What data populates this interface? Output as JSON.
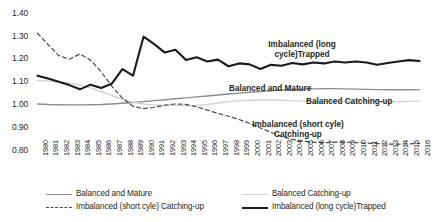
{
  "chart_data": {
    "type": "line",
    "title": "",
    "xlabel": "",
    "ylabel": "",
    "ylim": [
      0.8,
      1.4
    ],
    "ytick_labels": [
      "1.40",
      "1.30",
      "1.20",
      "1.10",
      "1.00",
      "0.90",
      "0.80"
    ],
    "ytick_values": [
      1.4,
      1.3,
      1.2,
      1.1,
      1.0,
      0.9,
      0.8
    ],
    "grid": false,
    "legend_position": "bottom",
    "x": [
      1980,
      1981,
      1982,
      1983,
      1984,
      1985,
      1986,
      1987,
      1988,
      1989,
      1990,
      1991,
      1992,
      1993,
      1994,
      1995,
      1996,
      1997,
      1998,
      1999,
      2000,
      2001,
      2002,
      2003,
      2004,
      2005,
      2006,
      2007,
      2008,
      2009,
      2010,
      2011,
      2012,
      2013,
      2014,
      2015,
      2016
    ],
    "categories": [
      "1980",
      "1981",
      "1982",
      "1983",
      "1984",
      "1985",
      "1986",
      "1987",
      "1988",
      "1989",
      "1990",
      "1991",
      "1992",
      "1993",
      "1994",
      "1995",
      "1996",
      "1997",
      "1998",
      "1999",
      "2000",
      "2001",
      "2002",
      "2003",
      "2004",
      "2005",
      "2006",
      "2007",
      "2008",
      "2009",
      "2010",
      "2011",
      "2012",
      "2013",
      "2014",
      "2015",
      "2016"
    ],
    "series": [
      {
        "name": "Balanced and Mature",
        "style": "solid",
        "color": "#8d8d8d",
        "width": 1.4,
        "values": [
          1.01,
          1.008,
          1.007,
          1.006,
          1.006,
          1.007,
          1.008,
          1.01,
          1.013,
          1.016,
          1.02,
          1.024,
          1.028,
          1.032,
          1.036,
          1.04,
          1.044,
          1.048,
          1.052,
          1.056,
          1.06,
          1.063,
          1.066,
          1.069,
          1.071,
          1.073,
          1.074,
          1.075,
          1.075,
          1.074,
          1.073,
          1.072,
          1.071,
          1.07,
          1.07,
          1.07,
          1.071
        ]
      },
      {
        "name": "Balanced Catching-up",
        "style": "solid",
        "color": "#d2d2d2",
        "width": 1.4,
        "values": [
          1.11,
          1.107,
          1.103,
          1.098,
          1.09,
          1.078,
          1.063,
          1.046,
          1.03,
          1.018,
          1.01,
          1.006,
          1.004,
          1.003,
          1.003,
          1.004,
          1.008,
          1.014,
          1.02,
          1.024,
          1.026,
          1.027,
          1.027,
          1.026,
          1.024,
          1.022,
          1.021,
          1.02,
          1.02,
          1.021,
          1.022,
          1.022,
          1.021,
          1.02,
          1.02,
          1.021,
          1.022
        ]
      },
      {
        "name": "Imbalanced (short cyle) Catching-up",
        "style": "dashed",
        "color": "#4a4a4a",
        "width": 1.2,
        "values": [
          1.31,
          1.262,
          1.215,
          1.2,
          1.222,
          1.196,
          1.146,
          1.086,
          1.034,
          1.0,
          0.99,
          0.996,
          1.005,
          1.01,
          1.008,
          0.998,
          0.984,
          0.97,
          0.958,
          0.944,
          0.928,
          0.908,
          0.89,
          0.872,
          0.86,
          0.852,
          0.848,
          0.846,
          0.848,
          0.848,
          0.846,
          0.844,
          0.842,
          0.84,
          0.84,
          0.841,
          0.843
        ]
      },
      {
        "name": "Imbalanced (long cycle)Trapped",
        "style": "solid",
        "color": "#1a1a1a",
        "width": 2.1,
        "values": [
          1.13,
          1.118,
          1.104,
          1.09,
          1.072,
          1.092,
          1.078,
          1.096,
          1.158,
          1.13,
          1.296,
          1.264,
          1.228,
          1.24,
          1.196,
          1.208,
          1.19,
          1.198,
          1.17,
          1.182,
          1.178,
          1.158,
          1.176,
          1.172,
          1.184,
          1.178,
          1.186,
          1.182,
          1.19,
          1.186,
          1.19,
          1.186,
          1.176,
          1.184,
          1.19,
          1.196,
          1.192
        ]
      }
    ],
    "annotations": [
      {
        "text_line1": "Imbalanced (long",
        "text_line2": "cycle)Trapped"
      },
      {
        "text_line1": "Balanced and Mature",
        "text_line2": ""
      },
      {
        "text_line1": "Balanced Catching-up",
        "text_line2": ""
      },
      {
        "text_line1": "Imbalanced (short cyle)",
        "text_line2": "Catching-up"
      }
    ],
    "legend": [
      {
        "label": "Balanced and Mature",
        "style": "solid",
        "color": "#8d8d8d"
      },
      {
        "label": "Balanced Catching-up",
        "style": "solid",
        "color": "#d2d2d2"
      },
      {
        "label": "Imbalanced (short cyle) Catching-up",
        "style": "dashed",
        "color": "#4a4a4a"
      },
      {
        "label": "Imbalanced (long cycle)Trapped",
        "style": "solid",
        "color": "#1a1a1a"
      }
    ]
  }
}
